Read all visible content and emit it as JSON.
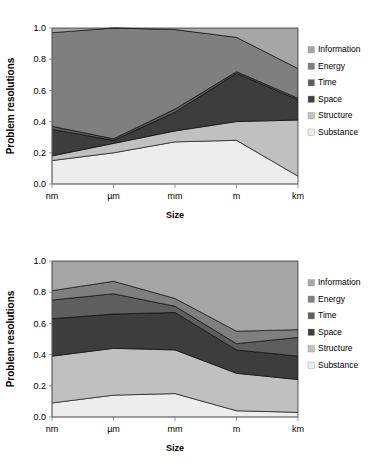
{
  "figure": {
    "background": "#ffffff",
    "plot_background": "#c8c8c8"
  },
  "legend": {
    "position": "right",
    "items": [
      {
        "label": "Information",
        "color": "#a6a6a6"
      },
      {
        "label": "Energy",
        "color": "#7f7f7f"
      },
      {
        "label": "Time",
        "color": "#5e5e5e"
      },
      {
        "label": "Space",
        "color": "#3d3d3d"
      },
      {
        "label": "Structure",
        "color": "#c0c0c0"
      },
      {
        "label": "Substance",
        "color": "#ededed"
      }
    ]
  },
  "chart_data": [
    {
      "type": "area",
      "id": "chart-top",
      "title": "",
      "xlabel": "Size",
      "ylabel": "Problem resolutions",
      "categories": [
        "nm",
        "µm",
        "mm",
        "m",
        "km"
      ],
      "ylim": [
        0.0,
        1.0
      ],
      "yticks": [
        "0.0",
        "0.2",
        "0.4",
        "0.6",
        "0.8",
        "1.0"
      ],
      "ytick_values": [
        0.0,
        0.2,
        0.4,
        0.6,
        0.8,
        1.0
      ],
      "grid": false,
      "stacked": true,
      "stack_order_bottom_to_top": [
        "Substance",
        "Structure",
        "Space",
        "Time",
        "Energy",
        "Information"
      ],
      "series": [
        {
          "name": "Substance",
          "color": "#ededed",
          "values": [
            0.15,
            0.2,
            0.27,
            0.28,
            0.05
          ]
        },
        {
          "name": "Structure",
          "color": "#c0c0c0",
          "values": [
            0.03,
            0.06,
            0.07,
            0.12,
            0.36
          ]
        },
        {
          "name": "Space",
          "color": "#3d3d3d",
          "values": [
            0.17,
            0.02,
            0.12,
            0.31,
            0.13
          ]
        },
        {
          "name": "Time",
          "color": "#5e5e5e",
          "values": [
            0.02,
            0.01,
            0.02,
            0.01,
            0.01
          ]
        },
        {
          "name": "Energy",
          "color": "#7f7f7f",
          "values": [
            0.6,
            0.71,
            0.51,
            0.22,
            0.19
          ]
        },
        {
          "name": "Information",
          "color": "#a6a6a6",
          "values": [
            0.03,
            0.0,
            0.01,
            0.06,
            0.26
          ]
        }
      ],
      "cumulative_tops": {
        "Substance": [
          0.15,
          0.2,
          0.27,
          0.28,
          0.05
        ],
        "Structure": [
          0.18,
          0.26,
          0.34,
          0.4,
          0.41
        ],
        "Space": [
          0.35,
          0.28,
          0.46,
          0.71,
          0.54
        ],
        "Time": [
          0.37,
          0.29,
          0.48,
          0.72,
          0.55
        ],
        "Energy": [
          0.97,
          1.0,
          0.99,
          0.94,
          0.74
        ],
        "Information": [
          1.0,
          1.0,
          1.0,
          1.0,
          1.0
        ]
      }
    },
    {
      "type": "area",
      "id": "chart-bottom",
      "title": "",
      "xlabel": "Size",
      "ylabel": "Problem resolutions",
      "categories": [
        "nm",
        "µm",
        "mm",
        "m",
        "km"
      ],
      "ylim": [
        0.0,
        1.0
      ],
      "yticks": [
        "0.0",
        "0.2",
        "0.4",
        "0.6",
        "0.8",
        "1.0"
      ],
      "ytick_values": [
        0.0,
        0.2,
        0.4,
        0.6,
        0.8,
        1.0
      ],
      "grid": false,
      "stacked": true,
      "stack_order_bottom_to_top": [
        "Substance",
        "Structure",
        "Space",
        "Time",
        "Energy",
        "Information"
      ],
      "series": [
        {
          "name": "Substance",
          "color": "#ededed",
          "values": [
            0.09,
            0.14,
            0.15,
            0.04,
            0.03
          ]
        },
        {
          "name": "Structure",
          "color": "#c0c0c0",
          "values": [
            0.3,
            0.3,
            0.28,
            0.24,
            0.21
          ]
        },
        {
          "name": "Space",
          "color": "#3d3d3d",
          "values": [
            0.24,
            0.22,
            0.24,
            0.15,
            0.15
          ]
        },
        {
          "name": "Time",
          "color": "#5e5e5e",
          "values": [
            0.12,
            0.13,
            0.04,
            0.04,
            0.12
          ]
        },
        {
          "name": "Energy",
          "color": "#7f7f7f",
          "values": [
            0.06,
            0.08,
            0.05,
            0.08,
            0.05
          ]
        },
        {
          "name": "Information",
          "color": "#a6a6a6",
          "values": [
            0.19,
            0.13,
            0.24,
            0.45,
            0.44
          ]
        }
      ],
      "cumulative_tops": {
        "Substance": [
          0.09,
          0.14,
          0.15,
          0.04,
          0.03
        ],
        "Structure": [
          0.39,
          0.44,
          0.43,
          0.28,
          0.24
        ],
        "Space": [
          0.63,
          0.66,
          0.67,
          0.43,
          0.39
        ],
        "Time": [
          0.75,
          0.79,
          0.71,
          0.47,
          0.51
        ],
        "Energy": [
          0.81,
          0.87,
          0.76,
          0.55,
          0.56
        ],
        "Information": [
          1.0,
          1.0,
          1.0,
          1.0,
          1.0
        ]
      }
    }
  ]
}
